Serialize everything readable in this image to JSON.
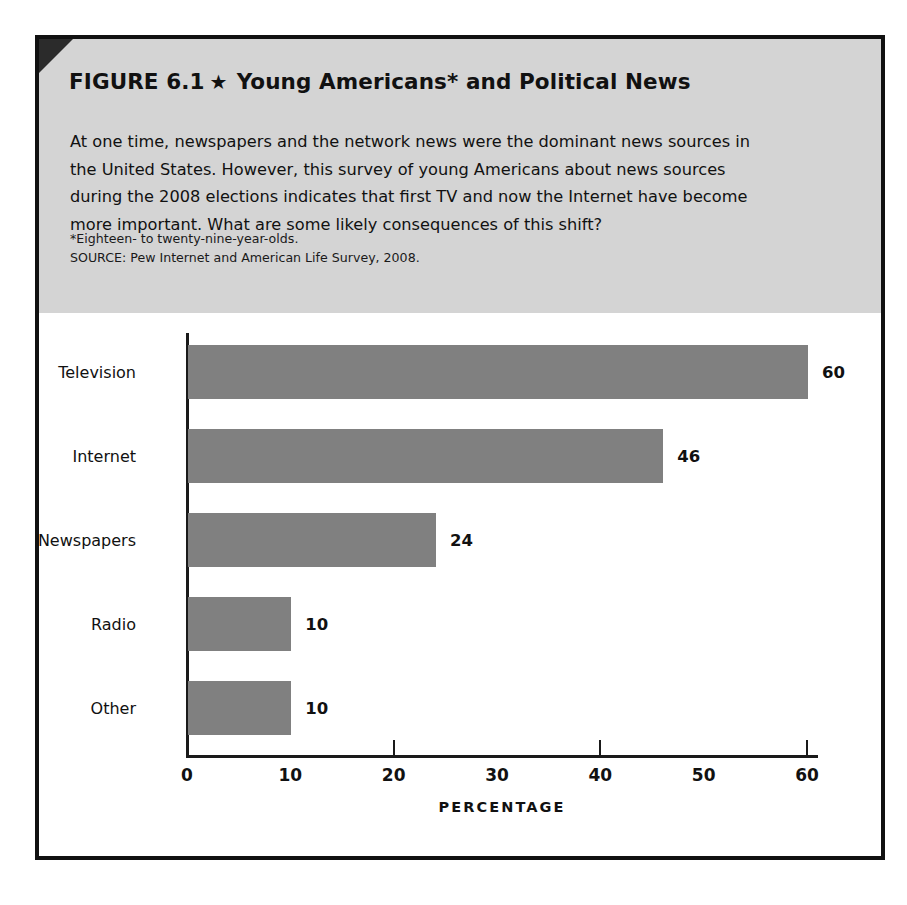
{
  "figure": {
    "label": "FIGURE 6.1",
    "star_icon": "★",
    "title": "Young Americans* and Political News",
    "body": "At one time, newspapers and the network news were the dominant news sources in the United States. However, this survey of young Americans about news sources during the 2008 elections indicates that first TV and now the Internet have become more important. What are some likely consequences of this shift?",
    "footnote": "*Eighteen- to twenty-nine-year-olds.",
    "source": "SOURCE: Pew Internet and American Life Survey, 2008.",
    "header_background": "#d4d4d4",
    "border_color": "#111111"
  },
  "chart_data": {
    "type": "bar",
    "orientation": "horizontal",
    "title": "Young Americans* and Political News",
    "categories": [
      "Television",
      "Internet",
      "Newspapers",
      "Radio",
      "Other"
    ],
    "values": [
      60,
      46,
      24,
      10,
      10
    ],
    "value_labels": [
      "60",
      "46",
      "24",
      "10",
      "10"
    ],
    "xlabel": "PERCENTAGE",
    "ylabel": "",
    "xlim": [
      0,
      60
    ],
    "xticks": [
      0,
      10,
      20,
      30,
      40,
      50,
      60
    ],
    "xtick_labels": [
      "0",
      "10",
      "20",
      "30",
      "40",
      "50",
      "60"
    ],
    "tick_marks_at": [
      20,
      40,
      60
    ],
    "grid": false,
    "legend": false,
    "bar_color": "#808080",
    "axis_color": "#1a1a1a"
  }
}
